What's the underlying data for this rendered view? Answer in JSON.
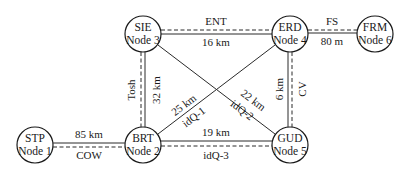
{
  "diagram": {
    "type": "network-topology",
    "nodes": [
      {
        "id": "node1",
        "code": "STP",
        "label": "Node 1",
        "x": 35,
        "y": 145
      },
      {
        "id": "node2",
        "code": "BRT",
        "label": "Node 2",
        "x": 143,
        "y": 145
      },
      {
        "id": "node3",
        "code": "SIE",
        "label": "Node 3",
        "x": 143,
        "y": 34
      },
      {
        "id": "node4",
        "code": "ERD",
        "label": "Node 4",
        "x": 290,
        "y": 34
      },
      {
        "id": "node5",
        "code": "GUD",
        "label": "Node 5",
        "x": 290,
        "y": 145
      },
      {
        "id": "node6",
        "code": "FRM",
        "label": "Node 6",
        "x": 375,
        "y": 34
      }
    ],
    "links": [
      {
        "id": "cow",
        "from": "node1",
        "to": "node2",
        "name": "COW",
        "distance": "85 km",
        "style": "double"
      },
      {
        "id": "tosh",
        "from": "node3",
        "to": "node2",
        "name": "Tosh",
        "distance": "32 km",
        "style": "double"
      },
      {
        "id": "ent",
        "from": "node3",
        "to": "node4",
        "name": "ENT",
        "distance": "16 km",
        "style": "double"
      },
      {
        "id": "fs",
        "from": "node4",
        "to": "node6",
        "name": "FS",
        "distance": "80 m",
        "style": "double"
      },
      {
        "id": "cv",
        "from": "node4",
        "to": "node5",
        "name": "CV",
        "distance": "6 km",
        "style": "double"
      },
      {
        "id": "idq1",
        "from": "node2",
        "to": "node4",
        "name": "idQ-1",
        "distance": "25 km",
        "style": "single"
      },
      {
        "id": "idq2",
        "from": "node3",
        "to": "node5",
        "name": "idQ-2",
        "distance": "22 km",
        "style": "single"
      },
      {
        "id": "idq3",
        "from": "node2",
        "to": "node5",
        "name": "idQ-3",
        "distance": "19 km",
        "style": "double"
      }
    ]
  },
  "colors": {
    "line": "#2a2a2a",
    "text": "#1a1a1a",
    "background": "#ffffff"
  }
}
